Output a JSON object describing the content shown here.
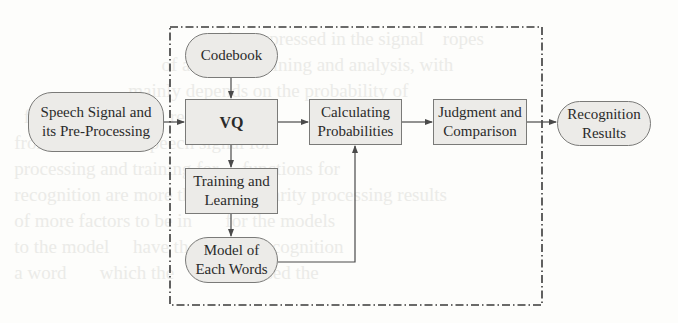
{
  "diagram": {
    "type": "flowchart",
    "boundary": {
      "style": "dash-dot",
      "label": ""
    },
    "nodes": [
      {
        "id": "speech",
        "label": "Speech Signal and its Pre-Processing",
        "line1": "Speech Signal and",
        "line2": "its Pre-Processing",
        "shape": "rounded"
      },
      {
        "id": "codebook",
        "label": "Codebook",
        "line1": "Codebook",
        "shape": "rounded"
      },
      {
        "id": "vq",
        "label": "VQ",
        "line1": "VQ",
        "shape": "rect"
      },
      {
        "id": "calc",
        "label": "Calculating Probabilities",
        "line1": "Calculating",
        "line2": "Probabilities",
        "shape": "rect"
      },
      {
        "id": "judge",
        "label": "Judgment and Comparison",
        "line1": "Judgment and",
        "line2": "Comparison",
        "shape": "rect"
      },
      {
        "id": "result",
        "label": "Recognition Results",
        "line1": "Recognition",
        "line2": "Results",
        "shape": "rounded"
      },
      {
        "id": "train",
        "label": "Training and Learning",
        "line1": "Training and",
        "line2": "Learning",
        "shape": "rect"
      },
      {
        "id": "model",
        "label": "Model of Each Words",
        "line1": "Model of",
        "line2": "Each Words",
        "shape": "rounded"
      }
    ],
    "edges": [
      {
        "from": "speech",
        "to": "vq"
      },
      {
        "from": "codebook",
        "to": "vq"
      },
      {
        "from": "vq",
        "to": "calc"
      },
      {
        "from": "vq",
        "to": "train"
      },
      {
        "from": "train",
        "to": "model"
      },
      {
        "from": "model",
        "to": "calc"
      },
      {
        "from": "calc",
        "to": "judge"
      },
      {
        "from": "judge",
        "to": "result"
      }
    ],
    "colors": {
      "node_fill": "#ecebe8",
      "stroke": "#555555",
      "text": "#2a2a2a"
    }
  }
}
